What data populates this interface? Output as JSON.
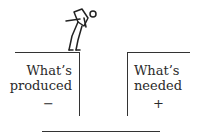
{
  "diagram": {
    "left_block": {
      "line1": "What’s",
      "line2": "produced",
      "sign": "−"
    },
    "right_block": {
      "line1": "What’s",
      "line2": "needed",
      "sign": "+"
    },
    "figure": "person-peering-into-gap-icon",
    "colors": {
      "ink": "#333333",
      "background": "#ffffff"
    }
  }
}
